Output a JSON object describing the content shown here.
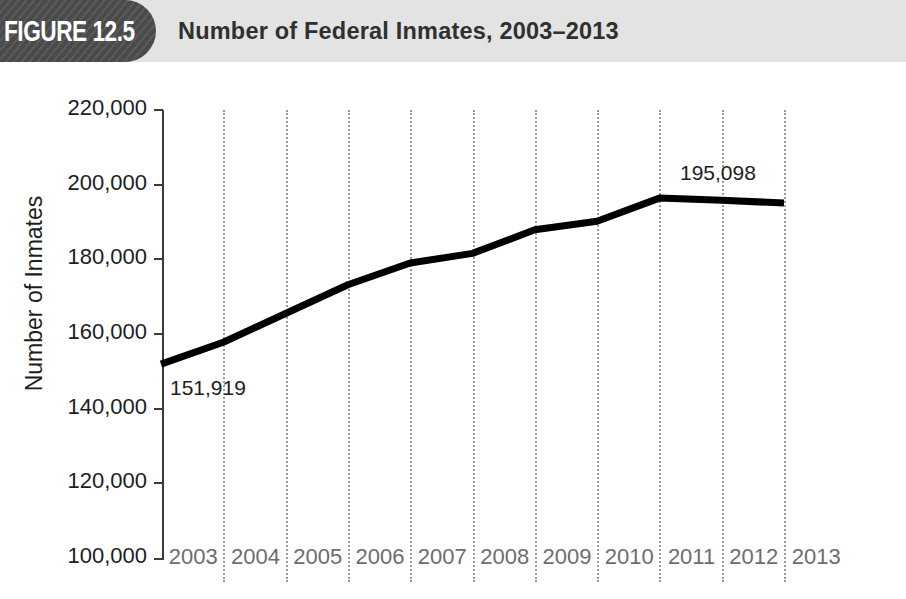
{
  "header": {
    "figure_tab_label": "FIGURE 12.5",
    "title": "Number of Federal Inmates, 2003–2013",
    "tab_color": "#4a4a4a",
    "band_color": "#e3e3e3"
  },
  "chart_data": {
    "type": "line",
    "title": "Number of Federal Inmates, 2003–2013",
    "xlabel": "",
    "ylabel": "Number of Inmates",
    "categories": [
      "2003",
      "2004",
      "2005",
      "2006",
      "2007",
      "2008",
      "2009",
      "2010",
      "2011",
      "2012",
      "2013"
    ],
    "values": [
      151919,
      157800,
      165500,
      173200,
      179000,
      181600,
      187900,
      190200,
      196400,
      195800,
      195098
    ],
    "series": [
      {
        "name": "Number of Inmates",
        "values": [
          151919,
          157800,
          165500,
          173200,
          179000,
          181600,
          187900,
          190200,
          196400,
          195800,
          195098
        ]
      }
    ],
    "ylim": [
      100000,
      220000
    ],
    "y_ticks": [
      "100,000",
      "120,000",
      "140,000",
      "160,000",
      "180,000",
      "200,000",
      "220,000"
    ],
    "y_tick_values": [
      100000,
      120000,
      140000,
      160000,
      180000,
      200000,
      220000
    ],
    "grid": "vertical-dotted",
    "legend": "none",
    "line_color": "#000000",
    "line_width": 7,
    "annotations": [
      {
        "text": "151,919",
        "value": 151919,
        "category": "2003",
        "position": "below-right"
      },
      {
        "text": "195,098",
        "value": 195098,
        "category": "2013",
        "position": "above-left"
      }
    ]
  },
  "axis": {
    "y_title": "Number of Inmates",
    "tick_color": "#3a3a3a",
    "x_label_color": "#6d6d6d",
    "gridline_color": "#9a9a9a"
  }
}
